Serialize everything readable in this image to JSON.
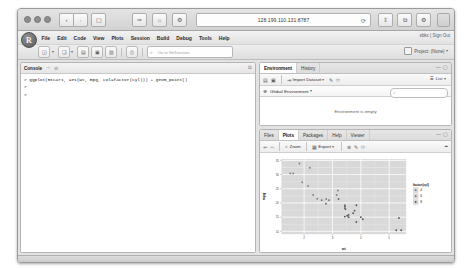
{
  "browser": {
    "url": "128.199.110.131:8787",
    "back_icon": "chevron-left-icon",
    "forward_icon": "chevron-right-icon",
    "sidebar_icon": "sidebar-icon",
    "reload_icon": "reload-icon",
    "share_icon": "share-icon",
    "tabs_icon": "tabs-icon",
    "settings_icon": "gear-icon"
  },
  "rstudio": {
    "logo": "R",
    "menus": [
      "File",
      "Edit",
      "Code",
      "View",
      "Plots",
      "Session",
      "Build",
      "Debug",
      "Tools",
      "Help"
    ],
    "account": "sbkx",
    "signout": "Sign Out",
    "project": "Project: (None)",
    "goto_placeholder": "Go to file/function"
  },
  "console": {
    "title": "Console",
    "path": "~/",
    "lines": [
      "> ggplot(mtcars, aes(wt, mpg, col=factor(cyl))) + geom_point()",
      ">",
      ">"
    ]
  },
  "environment": {
    "tabs": [
      "Environment",
      "History"
    ],
    "active_tab": "Environment",
    "import_label": "Import Dataset",
    "list_label": "List",
    "scope_label": "Global Environment",
    "search_placeholder": "",
    "empty_message": "Environment is empty",
    "broom_icon": "broom-icon",
    "save_icon": "save-icon",
    "open_icon": "open-icon",
    "refresh_icon": "refresh-icon"
  },
  "plots": {
    "tabs": [
      "Files",
      "Plots",
      "Packages",
      "Help",
      "Viewer"
    ],
    "active_tab": "Plots",
    "zoom_label": "Zoom",
    "export_label": "Export",
    "back_icon": "arrow-left-icon",
    "forward_icon": "arrow-right-icon",
    "remove_icon": "remove-icon",
    "clear_icon": "broom-icon",
    "refresh_icon": "refresh-icon"
  },
  "chart_data": {
    "type": "scatter",
    "title": "",
    "xlabel": "wt",
    "ylabel": "mpg",
    "xlim": [
      1.2,
      5.6
    ],
    "ylim": [
      9.0,
      35.5
    ],
    "xticks": [
      2,
      3,
      4,
      5
    ],
    "yticks": [
      10,
      15,
      20,
      25,
      30,
      35
    ],
    "grid": true,
    "panel_bg": "#d9d9d9",
    "grid_major": "#ffffff",
    "grid_minor": "#f0f0f0",
    "legend": {
      "title": "factor(cyl)",
      "position": "right",
      "entries": [
        {
          "label": "4",
          "color": "#7f7f7f"
        },
        {
          "label": "6",
          "color": "#6a6a6a"
        },
        {
          "label": "8",
          "color": "#555555"
        }
      ]
    },
    "series": [
      {
        "name": "4",
        "color": "#7f7f7f",
        "points": [
          {
            "x": 2.32,
            "y": 22.8
          },
          {
            "x": 3.19,
            "y": 24.4
          },
          {
            "x": 3.15,
            "y": 22.8
          },
          {
            "x": 2.2,
            "y": 32.4
          },
          {
            "x": 1.615,
            "y": 30.4
          },
          {
            "x": 1.835,
            "y": 33.9
          },
          {
            "x": 2.465,
            "y": 21.5
          },
          {
            "x": 1.935,
            "y": 27.3
          },
          {
            "x": 2.14,
            "y": 26.0
          },
          {
            "x": 1.513,
            "y": 30.4
          },
          {
            "x": 2.78,
            "y": 21.4
          }
        ]
      },
      {
        "name": "6",
        "color": "#6a6a6a",
        "points": [
          {
            "x": 2.62,
            "y": 21.0
          },
          {
            "x": 2.875,
            "y": 21.0
          },
          {
            "x": 3.215,
            "y": 21.4
          },
          {
            "x": 3.44,
            "y": 18.1
          },
          {
            "x": 3.44,
            "y": 19.2
          },
          {
            "x": 2.77,
            "y": 19.7
          },
          {
            "x": 3.46,
            "y": 17.8
          }
        ]
      },
      {
        "name": "8",
        "color": "#555555",
        "points": [
          {
            "x": 3.44,
            "y": 18.7
          },
          {
            "x": 4.07,
            "y": 14.3
          },
          {
            "x": 3.73,
            "y": 16.4
          },
          {
            "x": 3.78,
            "y": 17.3
          },
          {
            "x": 5.25,
            "y": 10.4
          },
          {
            "x": 5.424,
            "y": 10.4
          },
          {
            "x": 5.345,
            "y": 14.7
          },
          {
            "x": 3.52,
            "y": 15.5
          },
          {
            "x": 3.435,
            "y": 15.2
          },
          {
            "x": 3.84,
            "y": 13.3
          },
          {
            "x": 3.845,
            "y": 19.2
          },
          {
            "x": 3.57,
            "y": 15.8
          },
          {
            "x": 4.0,
            "y": 15.0
          },
          {
            "x": 3.57,
            "y": 15.0
          }
        ]
      }
    ]
  }
}
